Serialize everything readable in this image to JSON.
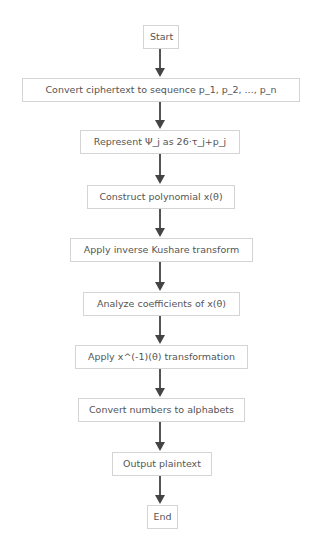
{
  "diagram": {
    "type": "flowchart",
    "direction": "top-to-bottom",
    "colors": {
      "node_border": "#d4d4d4",
      "node_text": "#555555",
      "arrow": "#555555",
      "background": "#ffffff"
    },
    "nodes": [
      {
        "id": "start",
        "label": "Start"
      },
      {
        "id": "convert_cipher",
        "label": "Convert ciphertext to sequence p_1, p_2, ..., p_n"
      },
      {
        "id": "represent",
        "label": "Represent Ψ_j as 26·τ_j+p_j"
      },
      {
        "id": "construct_poly",
        "label": "Construct polynomial x(θ)"
      },
      {
        "id": "inverse_kushare",
        "label": "Apply inverse Kushare transform"
      },
      {
        "id": "analyze_coeff",
        "label": "Analyze coefficients of x(θ)"
      },
      {
        "id": "apply_inverse_x",
        "label": "Apply x^(-1)(θ) transformation"
      },
      {
        "id": "convert_numbers",
        "label": "Convert numbers to alphabets"
      },
      {
        "id": "output_plain",
        "label": "Output plaintext"
      },
      {
        "id": "end",
        "label": "End"
      }
    ],
    "edges": [
      {
        "from": "start",
        "to": "convert_cipher"
      },
      {
        "from": "convert_cipher",
        "to": "represent"
      },
      {
        "from": "represent",
        "to": "construct_poly"
      },
      {
        "from": "construct_poly",
        "to": "inverse_kushare"
      },
      {
        "from": "inverse_kushare",
        "to": "analyze_coeff"
      },
      {
        "from": "analyze_coeff",
        "to": "apply_inverse_x"
      },
      {
        "from": "apply_inverse_x",
        "to": "convert_numbers"
      },
      {
        "from": "convert_numbers",
        "to": "output_plain"
      },
      {
        "from": "output_plain",
        "to": "end"
      }
    ]
  }
}
